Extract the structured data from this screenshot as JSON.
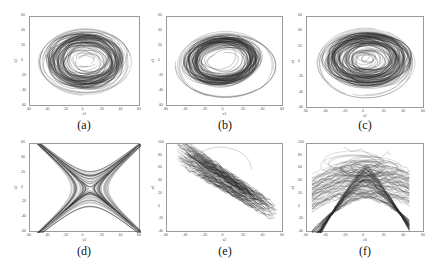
{
  "chart_data": [
    {
      "id": "a",
      "type": "line",
      "subtype": "phase-portrait",
      "caption": "(a)",
      "xlabel": "x1",
      "ylabel": "x2",
      "xlim": [
        -60,
        60
      ],
      "ylim": [
        -60,
        60
      ],
      "xticks": [
        -60,
        -40,
        -20,
        0,
        20,
        40,
        60
      ],
      "yticks": [
        -60,
        -40,
        -20,
        0,
        20,
        40,
        60
      ],
      "grid": false,
      "shape": "spiral-ring",
      "description": "Dense chaotic trajectory forming an elliptical ring centered near (0,0); outer loops reach about x ∈ [-55,50], y ∈ [-45,45]; hollow core near center",
      "box": {
        "left": 29,
        "top": 16,
        "width": 111,
        "height": 90
      },
      "caption_pos": {
        "x": 84,
        "y": 126
      }
    },
    {
      "id": "b",
      "type": "line",
      "subtype": "phase-portrait",
      "caption": "(b)",
      "xlabel": "x1",
      "ylabel": "x3",
      "xlim": [
        -60,
        60
      ],
      "ylim": [
        -60,
        60
      ],
      "xticks": [
        -60,
        -40,
        -20,
        0,
        20,
        40,
        60
      ],
      "yticks": [
        -60,
        -40,
        -20,
        0,
        20,
        40,
        60
      ],
      "grid": false,
      "shape": "tilted-ring",
      "description": "Chaotic torus-like ring with a clear hollow center near (-5,0); outer loops sweep down-left to about (-55,-45) and right to (50,-40)",
      "box": {
        "left": 166,
        "top": 16,
        "width": 117,
        "height": 90
      },
      "caption_pos": {
        "x": 225,
        "y": 126
      }
    },
    {
      "id": "c",
      "type": "line",
      "subtype": "phase-portrait",
      "caption": "(c)",
      "xlabel": "x2",
      "ylabel": "x4",
      "xlim": [
        -60,
        60
      ],
      "ylim": [
        -60,
        60
      ],
      "xticks": [
        -60,
        -40,
        -20,
        0,
        20,
        40,
        60
      ],
      "yticks": [
        -60,
        -40,
        -20,
        0,
        20,
        40,
        60
      ],
      "grid": false,
      "shape": "filled-ellipse",
      "description": "Densely filled elliptical attractor centered near (0,0) spanning about x ∈ [-50,55], y ∈ [-40,45]",
      "box": {
        "left": 306,
        "top": 16,
        "width": 118,
        "height": 92
      },
      "caption_pos": {
        "x": 365,
        "y": 126
      }
    },
    {
      "id": "d",
      "type": "line",
      "subtype": "phase-portrait",
      "caption": "(d)",
      "xlabel": "x2",
      "ylabel": "x3",
      "xlim": [
        -60,
        60
      ],
      "ylim": [
        -60,
        60
      ],
      "xticks": [
        -60,
        -40,
        -20,
        0,
        20,
        40,
        60
      ],
      "yticks": [
        -60,
        -40,
        -20,
        0,
        20,
        40,
        60
      ],
      "grid": false,
      "shape": "x-butterfly",
      "description": "X-shaped / hourglass attractor with arms toward (-40,45), (45,45), (-50,-55), (50,-55); crossing at about (5,0)",
      "box": {
        "left": 29,
        "top": 143,
        "width": 111,
        "height": 89
      },
      "caption_pos": {
        "x": 84,
        "y": 252
      }
    },
    {
      "id": "e",
      "type": "line",
      "subtype": "phase-portrait",
      "caption": "(e)",
      "xlabel": "x2",
      "ylabel": "x4",
      "xlim": [
        -60,
        60
      ],
      "ylim": [
        -40,
        100
      ],
      "xticks": [
        -60,
        -40,
        -20,
        0,
        20,
        40,
        60
      ],
      "yticks": [
        -40,
        -20,
        0,
        20,
        40,
        60,
        80,
        100
      ],
      "grid": false,
      "shape": "diagonal-band",
      "description": "Trajectory band along a negative-slope diagonal from about (-50,80) to (55,-25); excursion loop up to about (-10,95)",
      "box": {
        "left": 166,
        "top": 143,
        "width": 117,
        "height": 89
      },
      "caption_pos": {
        "x": 225,
        "y": 252
      }
    },
    {
      "id": "f",
      "type": "line",
      "subtype": "phase-portrait",
      "caption": "(f)",
      "xlabel": "x3",
      "ylabel": "x4",
      "xlim": [
        -60,
        60
      ],
      "ylim": [
        -40,
        100
      ],
      "xticks": [
        -60,
        -40,
        -20,
        0,
        20,
        40,
        60
      ],
      "yticks": [
        -40,
        -20,
        0,
        20,
        40,
        60,
        80,
        100
      ],
      "grid": false,
      "shape": "saddle-bowtie",
      "description": "Bow-tie / saddle-shaped attractor with a concave lower edge peaking near (0,15) and arms to (-55,85), (-55,-25), (45,55), (45,-20); sparse loops up to about (-20,95)",
      "box": {
        "left": 306,
        "top": 143,
        "width": 118,
        "height": 89
      },
      "caption_pos": {
        "x": 365,
        "y": 252
      }
    }
  ],
  "colors": {
    "trajectory": "#2a2a2a",
    "axis": "#9a9a9a",
    "text": "#111111",
    "background": "#ffffff"
  }
}
